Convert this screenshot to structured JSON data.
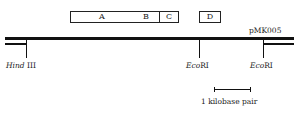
{
  "plasmid": {
    "name": "pMK005"
  },
  "genes": [
    {
      "label": "A"
    },
    {
      "label": "B"
    },
    {
      "label": "C"
    },
    {
      "label": "D"
    }
  ],
  "sites": [
    {
      "enzyme_italic": "Hind",
      "enzyme_rest": " III"
    },
    {
      "enzyme_italic": "Eco",
      "enzyme_rest": "RI"
    },
    {
      "enzyme_italic": "Eco",
      "enzyme_rest": "RI"
    }
  ],
  "scale_bar": {
    "label": "1 kilobase pair"
  }
}
